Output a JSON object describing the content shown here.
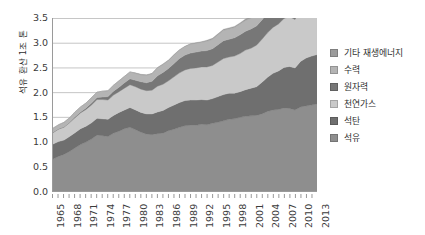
{
  "chart_data": {
    "type": "area",
    "stacked": true,
    "title": "",
    "xlabel": "",
    "ylabel": "석유 환산 1조 톤",
    "ylim": [
      0,
      3.5
    ],
    "yticks": [
      "0.0",
      "0.5",
      "1.0",
      "1.5",
      "2.0",
      "2.5",
      "3.0",
      "3.5"
    ],
    "ytick_values": [
      0,
      0.5,
      1,
      1.5,
      2,
      2.5,
      3,
      3.5
    ],
    "grid": "horizontal",
    "legend_position": "right",
    "xlim": [
      1965,
      2013
    ],
    "x": [
      1965,
      1966,
      1967,
      1968,
      1969,
      1970,
      1971,
      1972,
      1973,
      1974,
      1975,
      1976,
      1977,
      1978,
      1979,
      1980,
      1981,
      1982,
      1983,
      1984,
      1985,
      1986,
      1987,
      1988,
      1989,
      1990,
      1991,
      1992,
      1993,
      1994,
      1995,
      1996,
      1997,
      1998,
      1999,
      2000,
      2001,
      2002,
      2003,
      2004,
      2005,
      2006,
      2007,
      2008,
      2009,
      2010,
      2011,
      2012,
      2013
    ],
    "xtick_labels": [
      "1965",
      "1968",
      "1971",
      "1974",
      "1977",
      "1980",
      "1983",
      "1986",
      "1989",
      "1992",
      "1995",
      "1998",
      "2001",
      "2004",
      "2007",
      "2010",
      "2013"
    ],
    "xtick_values": [
      1965,
      1968,
      1971,
      1974,
      1977,
      1980,
      1983,
      1986,
      1989,
      1992,
      1995,
      1998,
      2001,
      2004,
      2007,
      2010,
      2013
    ],
    "series": [
      {
        "name": "석유",
        "color": "#8e8e8e",
        "values": [
          0.65,
          0.7,
          0.74,
          0.8,
          0.87,
          0.94,
          0.99,
          1.05,
          1.13,
          1.12,
          1.1,
          1.17,
          1.21,
          1.26,
          1.29,
          1.24,
          1.19,
          1.15,
          1.14,
          1.16,
          1.17,
          1.22,
          1.25,
          1.29,
          1.32,
          1.33,
          1.33,
          1.35,
          1.34,
          1.37,
          1.39,
          1.42,
          1.45,
          1.46,
          1.49,
          1.51,
          1.52,
          1.53,
          1.56,
          1.61,
          1.64,
          1.65,
          1.68,
          1.67,
          1.64,
          1.7,
          1.72,
          1.74,
          1.76
        ]
      },
      {
        "name": "석탄",
        "color": "#6f6f6f",
        "values": [
          0.3,
          0.3,
          0.29,
          0.3,
          0.31,
          0.32,
          0.32,
          0.33,
          0.34,
          0.34,
          0.35,
          0.36,
          0.38,
          0.38,
          0.4,
          0.4,
          0.4,
          0.41,
          0.42,
          0.44,
          0.46,
          0.47,
          0.49,
          0.5,
          0.51,
          0.51,
          0.51,
          0.5,
          0.5,
          0.5,
          0.52,
          0.53,
          0.53,
          0.52,
          0.52,
          0.54,
          0.56,
          0.58,
          0.64,
          0.69,
          0.74,
          0.78,
          0.82,
          0.85,
          0.85,
          0.92,
          0.97,
          0.99,
          1.0
        ]
      },
      {
        "name": "천연가스",
        "color": "#c9c9c9",
        "values": [
          0.23,
          0.25,
          0.26,
          0.28,
          0.3,
          0.32,
          0.34,
          0.36,
          0.38,
          0.39,
          0.39,
          0.41,
          0.42,
          0.44,
          0.46,
          0.47,
          0.47,
          0.47,
          0.48,
          0.52,
          0.53,
          0.54,
          0.57,
          0.6,
          0.62,
          0.64,
          0.65,
          0.66,
          0.67,
          0.67,
          0.7,
          0.73,
          0.73,
          0.75,
          0.77,
          0.8,
          0.81,
          0.84,
          0.87,
          0.9,
          0.93,
          0.95,
          0.99,
          1.01,
          0.98,
          1.06,
          1.09,
          1.11,
          1.13
        ]
      },
      {
        "name": "원자력",
        "color": "#777777",
        "values": [
          0.01,
          0.01,
          0.01,
          0.01,
          0.02,
          0.02,
          0.03,
          0.04,
          0.04,
          0.05,
          0.07,
          0.08,
          0.09,
          0.11,
          0.12,
          0.13,
          0.15,
          0.16,
          0.18,
          0.21,
          0.24,
          0.25,
          0.27,
          0.29,
          0.3,
          0.31,
          0.32,
          0.32,
          0.33,
          0.34,
          0.35,
          0.36,
          0.36,
          0.37,
          0.38,
          0.38,
          0.39,
          0.39,
          0.39,
          0.4,
          0.4,
          0.4,
          0.4,
          0.39,
          0.38,
          0.38,
          0.35,
          0.34,
          0.34
        ]
      },
      {
        "name": "수력",
        "color": "#b4b4b4",
        "values": [
          0.08,
          0.08,
          0.09,
          0.09,
          0.1,
          0.1,
          0.1,
          0.11,
          0.11,
          0.12,
          0.12,
          0.12,
          0.13,
          0.13,
          0.14,
          0.14,
          0.14,
          0.15,
          0.15,
          0.16,
          0.16,
          0.16,
          0.17,
          0.17,
          0.17,
          0.18,
          0.18,
          0.18,
          0.19,
          0.19,
          0.2,
          0.21,
          0.21,
          0.21,
          0.22,
          0.22,
          0.22,
          0.23,
          0.23,
          0.24,
          0.25,
          0.25,
          0.26,
          0.27,
          0.28,
          0.29,
          0.3,
          0.31,
          0.32
        ]
      },
      {
        "name": "기타 재생에너지",
        "color": "#9c9c9c",
        "values": [
          0.0,
          0.0,
          0.0,
          0.0,
          0.0,
          0.0,
          0.0,
          0.0,
          0.0,
          0.0,
          0.0,
          0.0,
          0.0,
          0.0,
          0.0,
          0.01,
          0.01,
          0.01,
          0.01,
          0.01,
          0.01,
          0.01,
          0.01,
          0.01,
          0.01,
          0.01,
          0.01,
          0.01,
          0.02,
          0.02,
          0.02,
          0.02,
          0.02,
          0.02,
          0.02,
          0.03,
          0.03,
          0.03,
          0.03,
          0.04,
          0.04,
          0.05,
          0.05,
          0.06,
          0.07,
          0.08,
          0.1,
          0.11,
          0.13
        ]
      }
    ]
  },
  "legend": {
    "items": [
      {
        "label": "기타 재생에너지",
        "color": "#9c9c9c"
      },
      {
        "label": "수력",
        "color": "#b4b4b4"
      },
      {
        "label": "원자력",
        "color": "#777777"
      },
      {
        "label": "천연가스",
        "color": "#c9c9c9"
      },
      {
        "label": "석탄",
        "color": "#6f6f6f"
      },
      {
        "label": "석유",
        "color": "#8e8e8e"
      }
    ]
  },
  "axes": {
    "grid_color": "#b6b6b6",
    "axis_color": "#9a9a9a",
    "tick_color": "#6d6d6d"
  }
}
